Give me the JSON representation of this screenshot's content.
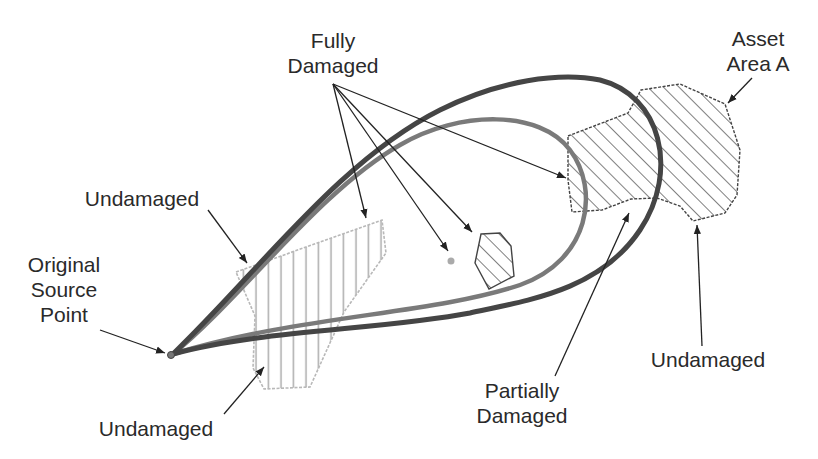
{
  "diagram": {
    "type": "plume-damage-schematic",
    "colors": {
      "background": "#ffffff",
      "text": "#2a2a2a",
      "outer_contour": "#454545",
      "inner_contour": "#7a7a7a",
      "hatch_dark": "#3a3a3a",
      "hatch_light": "#b0b0b0",
      "arrow": "#222222"
    },
    "labels": {
      "fully_damaged": "Fully\nDamaged",
      "asset_area_a": "Asset\nArea A",
      "undamaged_top_left": "Undamaged",
      "original_source_point": "Original\nSource\nPoint",
      "undamaged_bottom_left": "Undamaged",
      "partially_damaged": "Partially\nDamaged",
      "undamaged_right": "Undamaged"
    },
    "elements": {
      "source_point": {
        "x": 171,
        "y": 355
      },
      "outer_contour": "dark gray thick plume boundary",
      "inner_contour": "medium gray plume boundary",
      "asset_area_a": "diagonal-hatched polygon, right",
      "small_asset": "diagonal-hatched small polygon, center",
      "light_asset": "light vertical-hatched polygon, left",
      "point_target": {
        "x": 451,
        "y": 261
      }
    }
  }
}
